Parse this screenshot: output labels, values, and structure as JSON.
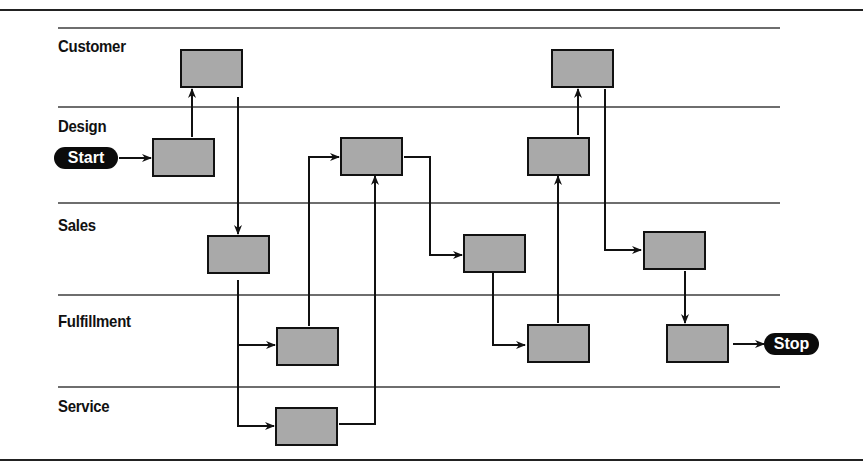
{
  "diagram": {
    "type": "swimlane-process-flow",
    "lanes": [
      {
        "id": "customer",
        "label": "Customer"
      },
      {
        "id": "design",
        "label": "Design"
      },
      {
        "id": "sales",
        "label": "Sales"
      },
      {
        "id": "fulfillment",
        "label": "Fulfillment"
      },
      {
        "id": "service",
        "label": "Service"
      }
    ],
    "terminals": {
      "start": {
        "label": "Start"
      },
      "stop": {
        "label": "Stop"
      }
    },
    "colors": {
      "box_fill": "#a9a9a9",
      "box_border": "#111111",
      "lane_line": "#6e6e6e",
      "terminal_fill": "#0b0b0b",
      "terminal_text": "#ffffff",
      "connector": "#111111"
    },
    "process_boxes": [
      {
        "id": "customer-1",
        "lane": "customer"
      },
      {
        "id": "design-1",
        "lane": "design"
      },
      {
        "id": "sales-1",
        "lane": "sales"
      },
      {
        "id": "fulfillment-1",
        "lane": "fulfillment"
      },
      {
        "id": "service-1",
        "lane": "service"
      },
      {
        "id": "design-2",
        "lane": "design"
      },
      {
        "id": "sales-2",
        "lane": "sales"
      },
      {
        "id": "fulfillment-2",
        "lane": "fulfillment"
      },
      {
        "id": "design-3",
        "lane": "design"
      },
      {
        "id": "customer-2",
        "lane": "customer"
      },
      {
        "id": "sales-3",
        "lane": "sales"
      },
      {
        "id": "fulfillment-3",
        "lane": "fulfillment"
      }
    ],
    "flows": [
      [
        "start",
        "design-1"
      ],
      [
        "design-1",
        "customer-1"
      ],
      [
        "customer-1",
        "sales-1"
      ],
      [
        "sales-1",
        "fulfillment-1"
      ],
      [
        "sales-1",
        "service-1"
      ],
      [
        "fulfillment-1",
        "design-2"
      ],
      [
        "service-1",
        "design-2"
      ],
      [
        "design-2",
        "sales-2"
      ],
      [
        "sales-2",
        "fulfillment-2"
      ],
      [
        "fulfillment-2",
        "design-3"
      ],
      [
        "design-3",
        "customer-2"
      ],
      [
        "customer-2",
        "sales-3"
      ],
      [
        "sales-3",
        "fulfillment-3"
      ],
      [
        "fulfillment-3",
        "stop"
      ]
    ]
  }
}
